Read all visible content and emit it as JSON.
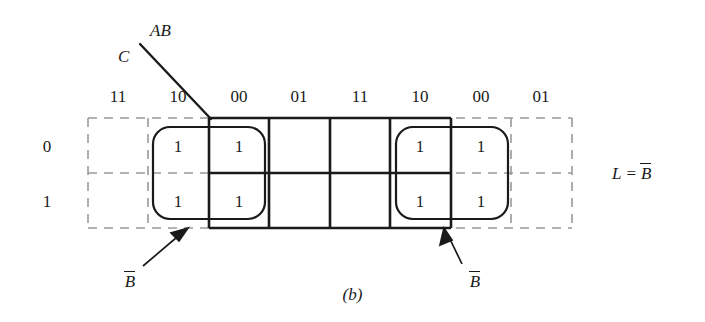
{
  "figure": {
    "caption": "(b)",
    "type": "karnaugh-map",
    "axis_labels": {
      "columns": "AB",
      "rows": "C"
    }
  },
  "kmap": {
    "column_headers": [
      "11",
      "10",
      "00",
      "01",
      "11",
      "10",
      "00",
      "01"
    ],
    "row_headers": [
      "0",
      "1"
    ],
    "main_grid_columns": [
      "00",
      "01",
      "11",
      "10"
    ],
    "cells": [
      [
        {
          "col": "11",
          "value": "",
          "ghost": true
        },
        {
          "col": "10",
          "value": "1",
          "ghost": true
        },
        {
          "col": "00",
          "value": "1",
          "ghost": false
        },
        {
          "col": "01",
          "value": "",
          "ghost": false
        },
        {
          "col": "11",
          "value": "",
          "ghost": false
        },
        {
          "col": "10",
          "value": "1",
          "ghost": false
        },
        {
          "col": "00",
          "value": "1",
          "ghost": true
        },
        {
          "col": "01",
          "value": "",
          "ghost": true
        }
      ],
      [
        {
          "col": "11",
          "value": "",
          "ghost": true
        },
        {
          "col": "10",
          "value": "1",
          "ghost": true
        },
        {
          "col": "00",
          "value": "1",
          "ghost": false
        },
        {
          "col": "01",
          "value": "",
          "ghost": false
        },
        {
          "col": "11",
          "value": "",
          "ghost": false
        },
        {
          "col": "10",
          "value": "1",
          "ghost": false
        },
        {
          "col": "00",
          "value": "1",
          "ghost": true
        },
        {
          "col": "01",
          "value": "",
          "ghost": true
        }
      ]
    ]
  },
  "groups": [
    {
      "id": "left-group",
      "label_base": "B",
      "label_complement": true,
      "spans_columns": [
        "10",
        "00"
      ]
    },
    {
      "id": "right-group",
      "label_base": "B",
      "label_complement": true,
      "spans_columns": [
        "10",
        "00"
      ]
    }
  ],
  "result": {
    "lhs": "L",
    "operator": "=",
    "rhs_base": "B",
    "rhs_complement": true
  },
  "colors": {
    "ink": "#1a1a1a",
    "dashed": "#9a9a9a",
    "background": "#ffffff"
  }
}
